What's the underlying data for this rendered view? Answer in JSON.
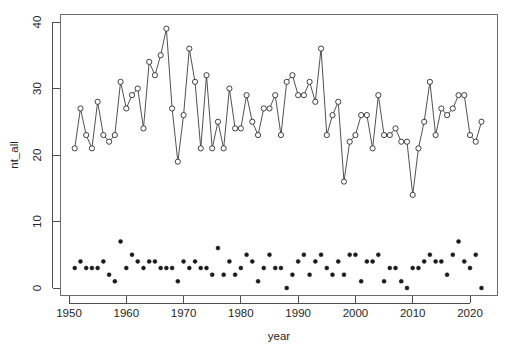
{
  "chart_data": {
    "type": "line",
    "title": "",
    "subtitle": "",
    "xlabel": "year",
    "ylabel": "nt_all",
    "xlim": [
      1950.0,
      2023.5
    ],
    "ylim": [
      -1.5,
      41.0
    ],
    "xticks": [
      1950,
      1960,
      1970,
      1980,
      1990,
      2000,
      2010,
      2020
    ],
    "yticks": [
      0,
      10,
      20,
      30,
      40
    ],
    "grid": false,
    "legend": null,
    "legend_position": "none",
    "x": [
      1951,
      1952,
      1953,
      1954,
      1955,
      1956,
      1957,
      1958,
      1959,
      1960,
      1961,
      1962,
      1963,
      1964,
      1965,
      1966,
      1967,
      1968,
      1969,
      1970,
      1971,
      1972,
      1973,
      1974,
      1975,
      1976,
      1977,
      1978,
      1979,
      1980,
      1981,
      1982,
      1983,
      1984,
      1985,
      1986,
      1987,
      1988,
      1989,
      1990,
      1991,
      1992,
      1993,
      1994,
      1995,
      1996,
      1997,
      1998,
      1999,
      2000,
      2001,
      2002,
      2003,
      2004,
      2005,
      2006,
      2007,
      2008,
      2009,
      2010,
      2011,
      2012,
      2013,
      2014,
      2015,
      2016,
      2017,
      2018,
      2019,
      2020,
      2021,
      2022
    ],
    "series": [
      {
        "name": "nt_all",
        "marker": "open-circle",
        "line": true,
        "values": [
          21,
          27,
          23,
          21,
          28,
          23,
          22,
          23,
          31,
          27,
          29,
          30,
          24,
          34,
          32,
          35,
          39,
          27,
          19,
          26,
          36,
          31,
          21,
          32,
          21,
          25,
          21,
          30,
          24,
          24,
          29,
          25,
          23,
          27,
          27,
          29,
          23,
          31,
          32,
          29,
          29,
          31,
          28,
          36,
          23,
          26,
          28,
          16,
          22,
          23,
          26,
          26,
          21,
          29,
          23,
          23,
          24,
          22,
          22,
          14,
          21,
          25,
          31,
          23,
          27,
          26,
          27,
          29,
          29,
          23,
          22,
          25
        ]
      },
      {
        "name": "major",
        "marker": "solid-circle",
        "line": false,
        "values": [
          3,
          4,
          3,
          3,
          3,
          4,
          2,
          1,
          7,
          3,
          5,
          4,
          3,
          4,
          4,
          3,
          3,
          3,
          1,
          4,
          3,
          4,
          3,
          3,
          2,
          6,
          2,
          4,
          2,
          3,
          5,
          4,
          1,
          3,
          5,
          3,
          3,
          0,
          2,
          4,
          5,
          2,
          4,
          5,
          3,
          2,
          4,
          2,
          5,
          5,
          1,
          4,
          4,
          5,
          1,
          3,
          3,
          1,
          0,
          3,
          3,
          4,
          5,
          4,
          4,
          2,
          5,
          7,
          4,
          3,
          5,
          0
        ]
      }
    ]
  },
  "axis": {
    "x_title": "year",
    "y_title": "nt_all",
    "x_tick_labels": [
      "1950",
      "1960",
      "1970",
      "1980",
      "1990",
      "2000",
      "2010",
      "2020"
    ],
    "y_tick_labels": [
      "0",
      "10",
      "20",
      "30",
      "40"
    ]
  },
  "colors": {
    "background": "#ffffff",
    "axis": "#4d4d4d",
    "box": "#6b6b6b",
    "line": "#3d3d3d",
    "open_marker_fill": "#ffffff",
    "open_marker_stroke": "#2b2b2b",
    "solid_marker": "#1a1a1a"
  }
}
